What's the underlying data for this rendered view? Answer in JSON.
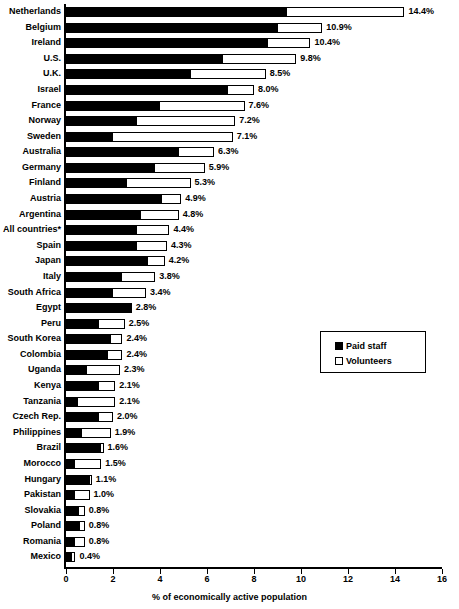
{
  "chart_data": {
    "type": "bar",
    "orientation": "horizontal",
    "stacked": true,
    "title": "",
    "subtitle": "",
    "xlabel": "% of economically active population",
    "ylabel": "",
    "xlim": [
      0,
      16
    ],
    "xticks": [
      0,
      2,
      4,
      6,
      8,
      10,
      12,
      14,
      16
    ],
    "xtick_labels": [
      "0",
      "2",
      "4",
      "6",
      "8",
      "10",
      "12",
      "14",
      "16"
    ],
    "grid": false,
    "legend_position": "middle-right",
    "legend": [
      {
        "label": "Paid staff",
        "swatch": "filled-black-square"
      },
      {
        "label": "Volunteers",
        "swatch": "open-white-square"
      }
    ],
    "categories": [
      "Netherlands",
      "Belgium",
      "Ireland",
      "U.S.",
      "U.K.",
      "Israel",
      "France",
      "Norway",
      "Sweden",
      "Australia",
      "Germany",
      "Finland",
      "Austria",
      "Argentina",
      "All countries*",
      "Spain",
      "Japan",
      "Italy",
      "South Africa",
      "Egypt",
      "Peru",
      "South Korea",
      "Colombia",
      "Uganda",
      "Kenya",
      "Tanzania",
      "Czech Rep.",
      "Philippines",
      "Brazil",
      "Morocco",
      "Hungary",
      "Pakistan",
      "Slovakia",
      "Poland",
      "Romania",
      "Mexico"
    ],
    "series": [
      {
        "name": "Paid staff",
        "values": [
          9.4,
          9.0,
          8.6,
          6.7,
          5.3,
          6.9,
          4.0,
          3.0,
          2.0,
          4.8,
          3.8,
          2.6,
          4.1,
          3.2,
          3.0,
          3.0,
          3.5,
          2.4,
          2.0,
          2.8,
          1.4,
          1.9,
          1.8,
          0.9,
          1.4,
          0.5,
          1.4,
          0.7,
          1.5,
          0.4,
          1.0,
          0.4,
          0.55,
          0.6,
          0.4,
          0.25
        ]
      },
      {
        "name": "Volunteers",
        "values": [
          5.0,
          1.9,
          1.8,
          3.1,
          3.2,
          1.1,
          3.6,
          4.2,
          5.1,
          1.5,
          2.1,
          2.7,
          0.8,
          1.6,
          1.4,
          1.3,
          0.7,
          1.4,
          1.4,
          0.0,
          1.1,
          0.5,
          0.6,
          1.4,
          0.7,
          1.6,
          0.6,
          1.2,
          0.1,
          1.1,
          0.1,
          0.6,
          0.25,
          0.2,
          0.4,
          0.15
        ]
      }
    ],
    "totals": [
      14.4,
      10.9,
      10.4,
      9.8,
      8.5,
      8.0,
      7.6,
      7.2,
      7.1,
      6.3,
      5.9,
      5.3,
      4.9,
      4.8,
      4.4,
      4.3,
      4.2,
      3.8,
      3.4,
      2.8,
      2.5,
      2.4,
      2.4,
      2.3,
      2.1,
      2.1,
      2.0,
      1.9,
      1.6,
      1.5,
      1.1,
      1.0,
      0.8,
      0.8,
      0.8,
      0.4
    ],
    "total_labels": [
      "14.4%",
      "10.9%",
      "10.4%",
      "9.8%",
      "8.5%",
      "8.0%",
      "7.6%",
      "7.2%",
      "7.1%",
      "6.3%",
      "5.9%",
      "5.3%",
      "4.9%",
      "4.8%",
      "4.4%",
      "4.3%",
      "4.2%",
      "3.8%",
      "3.4%",
      "2.8%",
      "2.5%",
      "2.4%",
      "2.4%",
      "2.3%",
      "2.1%",
      "2.1%",
      "2.0%",
      "1.9%",
      "1.6%",
      "1.5%",
      "1.1%",
      "1.0%",
      "0.8%",
      "0.8%",
      "0.8%",
      "0.4%"
    ],
    "colors": {
      "paid_staff": "#000000",
      "volunteers": "#ffffff",
      "outline": "#000000"
    }
  }
}
